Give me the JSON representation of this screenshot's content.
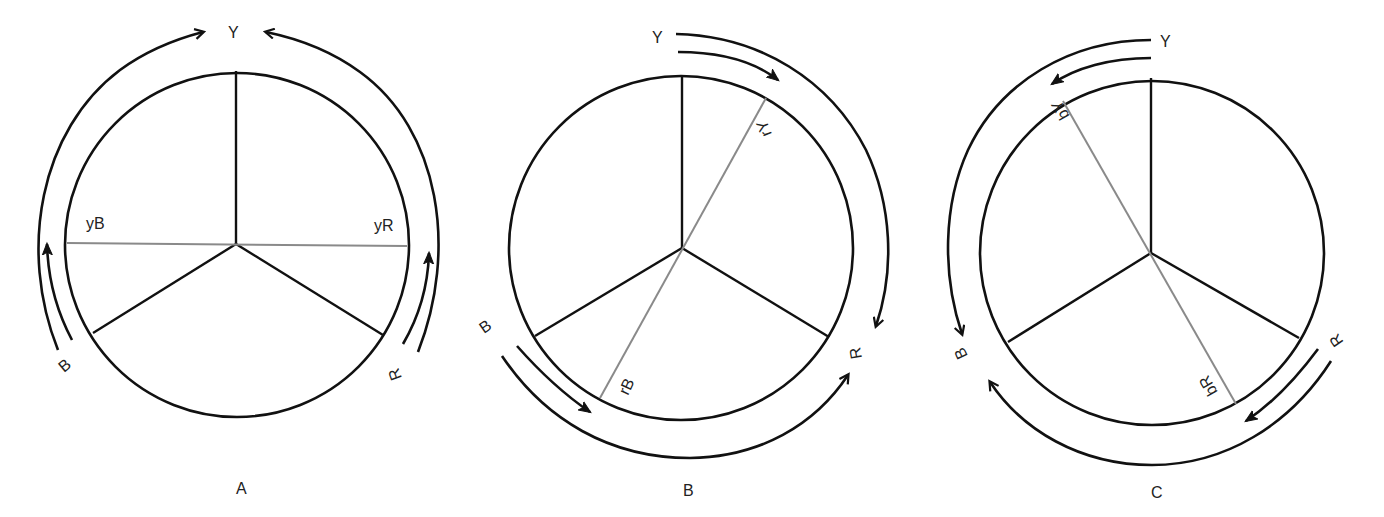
{
  "figure": {
    "panels": [
      {
        "caption": "A",
        "top_label": "Y",
        "left_label": "B",
        "right_label": "R",
        "chord_labels": [
          "yB",
          "yR"
        ],
        "chord_orientation": "horizontal (B side to R side)",
        "arrows": "from B and R up toward Y"
      },
      {
        "caption": "B",
        "top_label": "Y",
        "left_label": "B",
        "right_label": "R",
        "chord_labels": [
          "rY",
          "rB"
        ],
        "chord_orientation": "diagonal from upper-right to lower-left",
        "arrows": "from Y and B clockwise/counter-clockwise toward R"
      },
      {
        "caption": "C",
        "top_label": "Y",
        "left_label": "B",
        "right_label": "R",
        "chord_labels": [
          "bY",
          "bR"
        ],
        "chord_orientation": "diagonal from upper-left to lower-right",
        "arrows": "from Y and R toward B"
      }
    ]
  },
  "colors": {
    "stroke": "#111111",
    "chord": "#8a8a8a",
    "background": "#ffffff"
  }
}
